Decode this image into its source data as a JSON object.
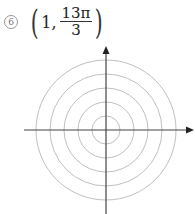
{
  "problem": {
    "number": "6",
    "number_symbol": "⑥",
    "point": {
      "r": "1,",
      "theta_numerator": "13π",
      "theta_denominator": "3"
    },
    "open_paren": "(",
    "close_paren": ")"
  },
  "polar_grid": {
    "center": [
      106,
      130
    ],
    "circle_radii": [
      14,
      28,
      42,
      56,
      70
    ],
    "circle_color": "#b8b8b8",
    "axis_color": "#444444"
  }
}
